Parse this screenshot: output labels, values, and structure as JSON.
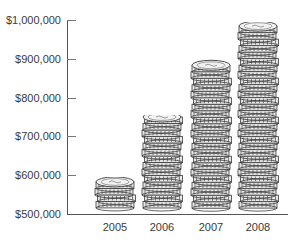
{
  "chart_data": {
    "type": "bar",
    "style": "pictograph-coin-stacks",
    "title": "",
    "xlabel": "",
    "ylabel": "",
    "categories": [
      "2005",
      "2006",
      "2007",
      "2008"
    ],
    "values": [
      590000,
      750000,
      895000,
      990000
    ],
    "ylim": [
      500000,
      1000000
    ],
    "yticks": [
      "$500,000",
      "$600,000",
      "$700,000",
      "$800,000",
      "$900,000",
      "$1,000,000"
    ],
    "ytick_values": [
      500000,
      600000,
      700000,
      800000,
      900000,
      1000000
    ],
    "grid": false,
    "legend": null
  },
  "colors": {
    "coin_fill": "#e6e6e6",
    "coin_edge": "#3c3c3c",
    "axis": "#555555",
    "text": "#3a3a3a"
  }
}
